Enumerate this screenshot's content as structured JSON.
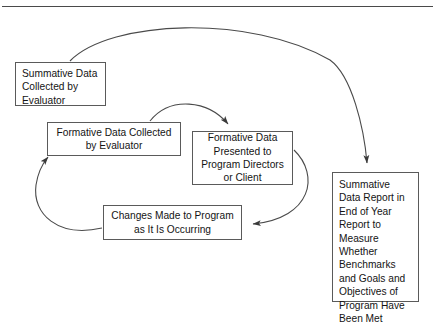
{
  "diagram": {
    "background_color": "#ffffff",
    "line_color": "#4a4a4a",
    "box_border_color": "#5a5a5a",
    "text_color": "#141414",
    "top_rule": true,
    "nodes": [
      {
        "id": "summative-collected",
        "text": "Summative Data Collected by Evaluator",
        "align": "left"
      },
      {
        "id": "formative-collected",
        "text": "Formative Data Collected by Evaluator",
        "align": "center"
      },
      {
        "id": "formative-presented",
        "text": "Formative Data Presented to Program Directors or Client",
        "align": "center"
      },
      {
        "id": "changes-made",
        "text": "Changes Made to Program as It Is Occurring",
        "align": "center"
      },
      {
        "id": "summative-report",
        "text": "Summative Data Report in End of Year Report to Measure Whether Benchmarks and Goals and Objectives of Program Have Been Met",
        "align": "left"
      }
    ],
    "connectors": [
      {
        "id": "arc-summative-to-report",
        "from": "summative-collected",
        "to": "summative-report",
        "style": "curved-arrow"
      },
      {
        "id": "arc-formative-collected-to-presented",
        "from": "formative-collected",
        "to": "formative-presented",
        "style": "curved-arrow"
      },
      {
        "id": "arc-presented-to-changes",
        "from": "formative-presented",
        "to": "changes-made",
        "style": "curved-arrow"
      },
      {
        "id": "arc-changes-to-formative-collected",
        "from": "changes-made",
        "to": "formative-collected",
        "style": "curved-arrow"
      }
    ]
  }
}
